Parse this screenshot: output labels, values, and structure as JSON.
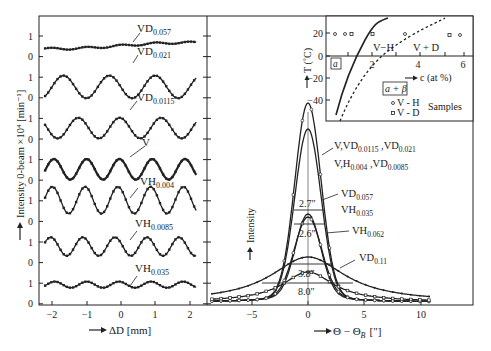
{
  "chart_data": [
    {
      "type": "line",
      "title": "",
      "xlabel": "→ ΔD [mm]",
      "ylabel": "→ Intensity 0-beam ×10⁴ [min⁻¹]",
      "xlim": [
        -2.3,
        2.5
      ],
      "x_ticks": [
        -2,
        -1,
        0,
        1,
        2
      ],
      "y_tick_labels": [
        "1",
        "0",
        "1",
        "0",
        "1",
        "0",
        "1",
        "0",
        "1",
        "0",
        "1",
        "0",
        "1",
        "0"
      ],
      "grid": false,
      "legend": "inline labels",
      "series": [
        {
          "name": "VD0.057",
          "label_main": "VD",
          "label_sub": "0.057",
          "amplitude": 0.05,
          "period_mm": 1.0,
          "offset_rows": 0,
          "mean": 0.5
        },
        {
          "name": "VD0.021",
          "label_main": "VD",
          "label_sub": "0.021",
          "amplitude": 0.55,
          "period_mm": 1.33,
          "offset_rows": 1,
          "mean": 0.5
        },
        {
          "name": "VD0.0115",
          "label_main": "VD",
          "label_sub": "0.0115",
          "amplitude": 0.5,
          "period_mm": 1.2,
          "offset_rows": 2,
          "mean": 0.5
        },
        {
          "name": "V",
          "label_main": "V",
          "label_sub": "",
          "amplitude": 0.5,
          "period_mm": 0.95,
          "offset_rows": 3,
          "mean": 0.5
        },
        {
          "name": "VH0.004",
          "label_main": "VH",
          "label_sub": "0.004",
          "amplitude": 0.65,
          "period_mm": 0.95,
          "offset_rows": 4,
          "mean": 1.0
        },
        {
          "name": "VH0.0085",
          "label_main": "VH",
          "label_sub": "0.0085",
          "amplitude": 0.45,
          "period_mm": 0.93,
          "offset_rows": 5,
          "mean": 0.75
        },
        {
          "name": "VH0.035",
          "label_main": "VH",
          "label_sub": "0.035",
          "amplitude": 0.15,
          "period_mm": 0.93,
          "offset_rows": 6,
          "mean": 0.9
        }
      ]
    },
    {
      "type": "line",
      "title": "",
      "xlabel": "→ Θ - ΘB [\"]",
      "ylabel": "→ Intensity",
      "xlim": [
        -9,
        14
      ],
      "x_ticks": [
        -5,
        0,
        5,
        10
      ],
      "grid": false,
      "series": [
        {
          "name": "V,VD0.0115,VD0.021",
          "peak_rel": 1.0,
          "fwhm_arcsec": 2.7
        },
        {
          "name": "V,H0.004,VD0.0085",
          "peak_rel": 0.87,
          "fwhm_arcsec": 2.7
        },
        {
          "name": "VD0.057 / VH0.035",
          "peak_rel": 0.4,
          "fwhm_arcsec": 2.6
        },
        {
          "name": "VH0.062",
          "peak_rel": 0.4,
          "fwhm_arcsec": 2.6
        },
        {
          "name": "VD0.11",
          "peak_rel": 0.24,
          "fwhm_arcsec": 8.0
        }
      ],
      "annotations": [
        "2.7\"",
        "2.6\"",
        "3.8\"",
        "8.0\""
      ]
    },
    {
      "type": "scatter",
      "title": "phase diagram inset",
      "xlabel": "→ c (at %)",
      "ylabel": "→ T (°C)",
      "x_ticks": [
        2,
        4,
        6
      ],
      "y_ticks": [
        20,
        0,
        -20,
        -40
      ],
      "regions": [
        "a",
        "a + β",
        "V - H",
        "V + D"
      ],
      "legend": [
        {
          "marker": "circle",
          "label": "V - H"
        },
        {
          "marker": "square",
          "label": "V - D"
        },
        {
          "label": "Samples"
        }
      ],
      "samples_T": 20,
      "samples_c": [
        0.3,
        0.8,
        1.0,
        2.2,
        3.4,
        5.5,
        5.9
      ]
    }
  ],
  "left": {
    "y_ticks": [
      "1",
      "0",
      "1",
      "0",
      "1",
      "0",
      "1",
      "0",
      "1",
      "0",
      "1",
      "0",
      "1",
      "0"
    ],
    "x_ticks": [
      "−2",
      "−1",
      "0",
      "1",
      "2"
    ],
    "xlabel": "ΔD [mm]",
    "ylabel": "Intensity 0-beam ×10⁴ [min⁻¹]",
    "labels": [
      {
        "main": "VD",
        "sub": "0.057"
      },
      {
        "main": "VD",
        "sub": "0.021"
      },
      {
        "main": "VD",
        "sub": "0.0115"
      },
      {
        "main": "V",
        "sub": ""
      },
      {
        "main": "VH",
        "sub": "0.004"
      },
      {
        "main": "VH",
        "sub": "0.0085"
      },
      {
        "main": "VH",
        "sub": "0.035"
      }
    ]
  },
  "right": {
    "x_ticks": [
      "−5",
      "0",
      "5",
      "10"
    ],
    "xlabel_a": "Θ − Θ",
    "xlabel_sub": "B",
    "xlabel_b": "[\"]",
    "ylabel": "Intensity",
    "label1": {
      "a": "V,VD",
      "s1": "0.0115",
      "b": " ,VD",
      "s2": "0.021"
    },
    "label2": {
      "a": "V,H",
      "s1": "0.004",
      "b": " ,VD",
      "s2": "0.0085"
    },
    "label3": {
      "main": "VD",
      "sub": "0.057"
    },
    "label4": {
      "main": "VH",
      "sub": "0.035"
    },
    "label5": {
      "main": "VH",
      "sub": "0.062"
    },
    "label6": {
      "main": "VD",
      "sub": "0.11"
    },
    "w1": "2.7\"",
    "w2": "2.6\"",
    "w3": "3.8\"",
    "w4": "8.0\""
  },
  "inset": {
    "y_ticks": [
      "20",
      "0",
      "−20",
      "−40"
    ],
    "x_ticks": [
      "2",
      "4",
      "6"
    ],
    "ylabel": "T (˚C)",
    "xlabel": "c (at %)",
    "region_a": "a",
    "region_ab": "a + β",
    "region_vh": "V−H",
    "region_vd": "V + D",
    "legend_vh": "V - H",
    "legend_vd": "V - D",
    "legend_title": "Samples"
  }
}
